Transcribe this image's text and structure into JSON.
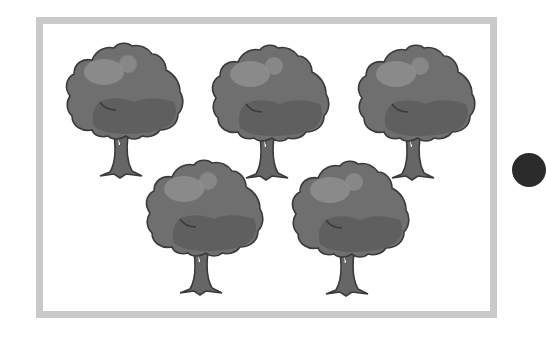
{
  "figure": {
    "tree_count": 5,
    "colors": {
      "frame": "#c9c9c9",
      "canopy": "#6e6e6e",
      "canopy_shadow": "#5e5e5e",
      "canopy_highlight": "#8f8f8f",
      "trunk": "#666666",
      "outline": "#3a3a3a",
      "partial_circle": "#2b2b2b"
    },
    "trees": [
      {
        "row": 1,
        "col": 1,
        "x": 62,
        "y": 40
      },
      {
        "row": 1,
        "col": 2,
        "x": 208,
        "y": 42
      },
      {
        "row": 1,
        "col": 3,
        "x": 354,
        "y": 42
      },
      {
        "row": 2,
        "col": 1,
        "x": 142,
        "y": 157
      },
      {
        "row": 2,
        "col": 2,
        "x": 288,
        "y": 158
      }
    ]
  }
}
